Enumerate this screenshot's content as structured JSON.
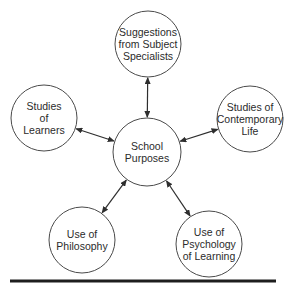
{
  "diagram": {
    "type": "hub-and-spoke",
    "center": {
      "id": "school-purposes",
      "lines": [
        "School",
        "Purposes"
      ],
      "cx": 147,
      "cy": 152,
      "r": 34
    },
    "nodes": [
      {
        "id": "subject-specialists",
        "lines": [
          "Suggestions",
          "from Subject",
          "Specialists"
        ],
        "cx": 148,
        "cy": 44,
        "r": 33
      },
      {
        "id": "studies-of-learners",
        "lines": [
          "Studies",
          "of",
          "Learners"
        ],
        "cx": 44,
        "cy": 118,
        "r": 33
      },
      {
        "id": "contemporary-life",
        "lines": [
          "Studies of",
          "Contemporary",
          "Life"
        ],
        "cx": 250,
        "cy": 119,
        "r": 33
      },
      {
        "id": "use-of-philosophy",
        "lines": [
          "Use of",
          "Philosophy"
        ],
        "cx": 82,
        "cy": 240,
        "r": 33
      },
      {
        "id": "psychology-of-learning",
        "lines": [
          "Use of",
          "Psychology",
          "of Learning"
        ],
        "cx": 209,
        "cy": 244,
        "r": 33
      }
    ],
    "edges": [
      {
        "from": "school-purposes",
        "to": "subject-specialists",
        "direction": "bidirectional"
      },
      {
        "from": "school-purposes",
        "to": "studies-of-learners",
        "direction": "bidirectional"
      },
      {
        "from": "school-purposes",
        "to": "contemporary-life",
        "direction": "bidirectional"
      },
      {
        "from": "school-purposes",
        "to": "use-of-philosophy",
        "direction": "bidirectional"
      },
      {
        "from": "school-purposes",
        "to": "psychology-of-learning",
        "direction": "bidirectional"
      }
    ],
    "colors": {
      "stroke": "#4a4a4a",
      "text": "#2b2b2b",
      "rule": "#1e1e1e",
      "background": "#ffffff"
    }
  }
}
